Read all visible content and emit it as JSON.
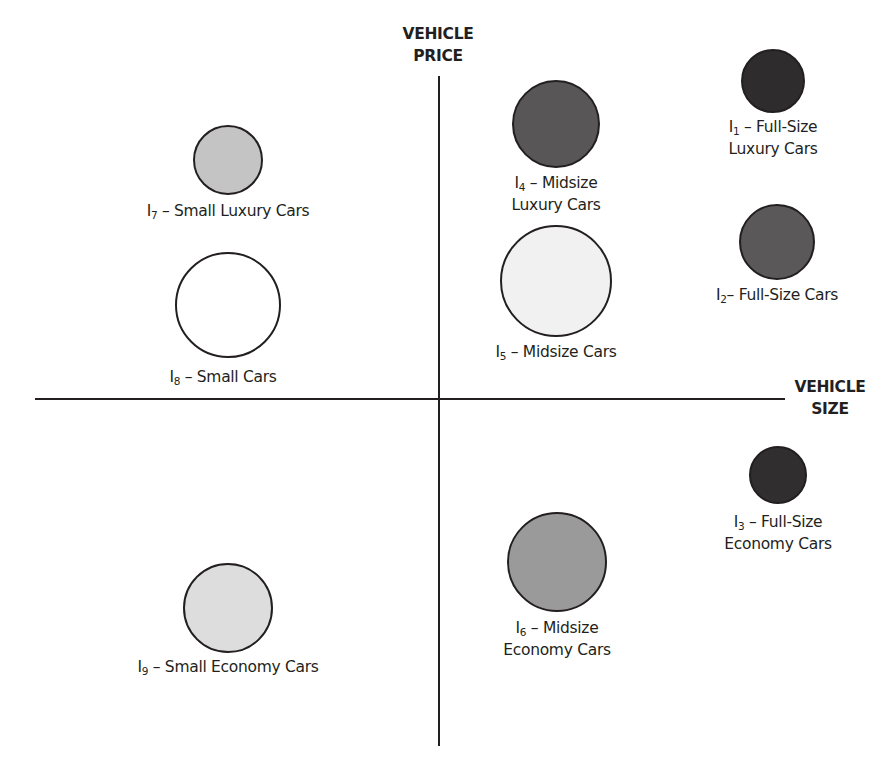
{
  "axes": {
    "y_label_line1": "VEHICLE",
    "y_label_line2": "PRICE",
    "x_label_line1": "VEHICLE",
    "x_label_line2": "SIZE"
  },
  "segments": [
    {
      "id": "I",
      "sub": "1",
      "text_line1": " – Full-Size",
      "text_line2": "Luxury Cars",
      "cx": 773,
      "cy": 81,
      "r": 32,
      "fill": "#2e2c2d"
    },
    {
      "id": "I",
      "sub": "2",
      "text_line1": "– Full-Size Cars",
      "text_line2": "",
      "cx": 777,
      "cy": 242,
      "r": 38,
      "fill": "#5a5859"
    },
    {
      "id": "I",
      "sub": "3",
      "text_line1": " – Full-Size",
      "text_line2": "Economy Cars",
      "cx": 778,
      "cy": 475,
      "r": 29,
      "fill": "#302e2f"
    },
    {
      "id": "I",
      "sub": "4",
      "text_line1": " – Midsize",
      "text_line2": "Luxury Cars",
      "cx": 556,
      "cy": 124,
      "r": 44,
      "fill": "#585657"
    },
    {
      "id": "I",
      "sub": "5",
      "text_line1": " – Midsize Cars",
      "text_line2": "",
      "cx": 556,
      "cy": 281,
      "r": 56,
      "fill": "#f1f1f1"
    },
    {
      "id": "I",
      "sub": "6",
      "text_line1": " – Midsize",
      "text_line2": "Economy Cars",
      "cx": 557,
      "cy": 562,
      "r": 50,
      "fill": "#9b9a9a"
    },
    {
      "id": "I",
      "sub": "7",
      "text_line1": " – Small Luxury Cars",
      "text_line2": "",
      "cx": 228,
      "cy": 160,
      "r": 35,
      "fill": "#c5c4c4"
    },
    {
      "id": "I",
      "sub": "8",
      "text_line1": " –  Small Cars",
      "text_line2": "",
      "cx": 228,
      "cy": 305,
      "r": 53,
      "fill": "#ffffff"
    },
    {
      "id": "I",
      "sub": "9",
      "text_line1": " – Small Economy Cars",
      "text_line2": "",
      "cx": 228,
      "cy": 608,
      "r": 45,
      "fill": "#dedddd"
    }
  ],
  "chart_data": {
    "type": "scatter",
    "title": "",
    "xlabel": "VEHICLE SIZE",
    "ylabel": "VEHICLE PRICE",
    "points": [
      {
        "label": "I1 – Full-Size Luxury Cars",
        "size": "large",
        "price": "high",
        "bubble_radius_px": 32
      },
      {
        "label": "I2 – Full-Size Cars",
        "size": "large",
        "price": "medium-high",
        "bubble_radius_px": 38
      },
      {
        "label": "I3 – Full-Size Economy Cars",
        "size": "large",
        "price": "low",
        "bubble_radius_px": 29
      },
      {
        "label": "I4 – Midsize Luxury Cars",
        "size": "medium",
        "price": "high",
        "bubble_radius_px": 44
      },
      {
        "label": "I5 – Midsize Cars",
        "size": "medium",
        "price": "medium-high",
        "bubble_radius_px": 56
      },
      {
        "label": "I6 – Midsize Economy Cars",
        "size": "medium",
        "price": "low",
        "bubble_radius_px": 50
      },
      {
        "label": "I7 – Small Luxury Cars",
        "size": "small",
        "price": "high",
        "bubble_radius_px": 35
      },
      {
        "label": "I8 – Small Cars",
        "size": "small",
        "price": "medium-high",
        "bubble_radius_px": 53
      },
      {
        "label": "I9 – Small Economy Cars",
        "size": "small",
        "price": "low",
        "bubble_radius_px": 45
      }
    ],
    "grid": false,
    "legend": "none"
  }
}
